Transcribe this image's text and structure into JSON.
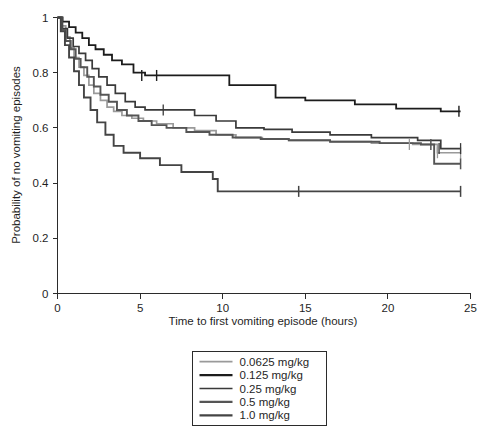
{
  "chart_data": {
    "type": "line",
    "subtype": "kaplan-meier-survival-step",
    "title": "",
    "xlabel": "Time to first vomiting episode (hours)",
    "ylabel": "Probability of no vomiting episodes",
    "xlim": [
      0,
      25
    ],
    "ylim": [
      0,
      1
    ],
    "xticks": [
      0,
      5,
      10,
      15,
      20,
      25
    ],
    "xtick_labels": [
      "0",
      "5",
      "10",
      "15",
      "20",
      "25"
    ],
    "yticks": [
      0,
      0.2,
      0.4,
      0.6,
      0.8,
      1
    ],
    "ytick_labels": [
      "0",
      "0.2",
      "0.4",
      "0.6",
      "0.8",
      "1"
    ],
    "grid": false,
    "legend_position": "bottom-center",
    "series": [
      {
        "name": "0.0625 mg/kg",
        "color": "#9a9a9a",
        "width": 1.7,
        "points": [
          [
            0.0,
            1.0
          ],
          [
            0.25,
            0.97
          ],
          [
            0.5,
            0.93
          ],
          [
            0.75,
            0.89
          ],
          [
            1.0,
            0.855
          ],
          [
            1.3,
            0.82
          ],
          [
            1.6,
            0.79
          ],
          [
            1.9,
            0.755
          ],
          [
            2.2,
            0.725
          ],
          [
            2.6,
            0.7
          ],
          [
            3.0,
            0.675
          ],
          [
            3.4,
            0.66
          ],
          [
            3.9,
            0.645
          ],
          [
            4.5,
            0.635
          ],
          [
            5.2,
            0.625
          ],
          [
            6.0,
            0.615
          ],
          [
            7.0,
            0.6
          ],
          [
            8.3,
            0.59
          ],
          [
            9.6,
            0.575
          ],
          [
            10.8,
            0.565
          ],
          [
            12.4,
            0.56
          ],
          [
            14.0,
            0.555
          ],
          [
            16.5,
            0.55
          ],
          [
            19.0,
            0.545
          ],
          [
            21.5,
            0.54
          ],
          [
            23.0,
            0.51
          ],
          [
            24.4,
            0.51
          ]
        ],
        "censored": [
          [
            21.3,
            0.54
          ],
          [
            23.0,
            0.51
          ],
          [
            24.4,
            0.51
          ]
        ],
        "final_value": 0.51
      },
      {
        "name": "0.125 mg/kg",
        "color": "#1c1c1c",
        "width": 1.8,
        "points": [
          [
            0.0,
            1.0
          ],
          [
            0.3,
            0.985
          ],
          [
            0.7,
            0.965
          ],
          [
            1.1,
            0.945
          ],
          [
            1.5,
            0.925
          ],
          [
            1.9,
            0.9
          ],
          [
            2.3,
            0.885
          ],
          [
            2.8,
            0.865
          ],
          [
            3.3,
            0.845
          ],
          [
            3.9,
            0.83
          ],
          [
            4.6,
            0.8
          ],
          [
            5.3,
            0.79
          ],
          [
            7.3,
            0.79
          ],
          [
            10.4,
            0.755
          ],
          [
            13.2,
            0.71
          ],
          [
            15.0,
            0.7
          ],
          [
            18.0,
            0.685
          ],
          [
            20.5,
            0.67
          ],
          [
            23.2,
            0.66
          ],
          [
            24.4,
            0.66
          ]
        ],
        "censored": [
          [
            5.1,
            0.79
          ],
          [
            6.0,
            0.79
          ],
          [
            24.3,
            0.66
          ]
        ],
        "final_value": 0.66
      },
      {
        "name": "0.25 mg/kg",
        "color": "#3a3a3a",
        "width": 1.7,
        "points": [
          [
            0.0,
            1.0
          ],
          [
            0.3,
            0.96
          ],
          [
            0.6,
            0.925
          ],
          [
            0.95,
            0.895
          ],
          [
            1.3,
            0.87
          ],
          [
            1.7,
            0.845
          ],
          [
            2.1,
            0.815
          ],
          [
            2.5,
            0.785
          ],
          [
            3.0,
            0.755
          ],
          [
            3.5,
            0.725
          ],
          [
            4.1,
            0.695
          ],
          [
            4.7,
            0.675
          ],
          [
            5.3,
            0.665
          ],
          [
            7.0,
            0.665
          ],
          [
            8.3,
            0.645
          ],
          [
            9.6,
            0.625
          ],
          [
            10.8,
            0.6
          ],
          [
            12.5,
            0.595
          ],
          [
            14.2,
            0.585
          ],
          [
            16.5,
            0.575
          ],
          [
            19.0,
            0.565
          ],
          [
            21.8,
            0.555
          ],
          [
            23.2,
            0.525
          ],
          [
            24.4,
            0.525
          ]
        ],
        "censored": [
          [
            6.4,
            0.665
          ],
          [
            23.1,
            0.525
          ],
          [
            24.4,
            0.525
          ]
        ],
        "final_value": 0.525
      },
      {
        "name": "0.5 mg/kg",
        "color": "#555555",
        "width": 1.9,
        "points": [
          [
            0.0,
            1.0
          ],
          [
            0.25,
            0.955
          ],
          [
            0.5,
            0.915
          ],
          [
            0.8,
            0.885
          ],
          [
            1.1,
            0.85
          ],
          [
            1.4,
            0.82
          ],
          [
            1.8,
            0.785
          ],
          [
            2.2,
            0.75
          ],
          [
            2.6,
            0.72
          ],
          [
            3.1,
            0.695
          ],
          [
            3.6,
            0.665
          ],
          [
            4.2,
            0.645
          ],
          [
            4.9,
            0.625
          ],
          [
            5.7,
            0.61
          ],
          [
            6.6,
            0.6
          ],
          [
            7.8,
            0.585
          ],
          [
            9.2,
            0.575
          ],
          [
            10.6,
            0.565
          ],
          [
            12.3,
            0.56
          ],
          [
            14.0,
            0.555
          ],
          [
            16.5,
            0.55
          ],
          [
            19.5,
            0.545
          ],
          [
            22.0,
            0.54
          ],
          [
            22.8,
            0.47
          ],
          [
            24.4,
            0.47
          ]
        ],
        "censored": [
          [
            22.6,
            0.54
          ],
          [
            24.4,
            0.47
          ]
        ],
        "final_value": 0.47
      },
      {
        "name": "1.0 mg/kg",
        "color": "#444444",
        "width": 1.9,
        "points": [
          [
            0.0,
            1.0
          ],
          [
            0.2,
            0.95
          ],
          [
            0.45,
            0.9
          ],
          [
            0.7,
            0.855
          ],
          [
            1.0,
            0.805
          ],
          [
            1.3,
            0.755
          ],
          [
            1.6,
            0.71
          ],
          [
            2.0,
            0.665
          ],
          [
            2.4,
            0.62
          ],
          [
            2.9,
            0.575
          ],
          [
            3.4,
            0.535
          ],
          [
            4.0,
            0.51
          ],
          [
            5.0,
            0.49
          ],
          [
            6.2,
            0.465
          ],
          [
            7.5,
            0.44
          ],
          [
            9.4,
            0.415
          ],
          [
            9.7,
            0.37
          ],
          [
            14.5,
            0.37
          ],
          [
            20.0,
            0.37
          ],
          [
            24.4,
            0.37
          ]
        ],
        "censored": [
          [
            14.6,
            0.37
          ],
          [
            24.4,
            0.37
          ]
        ],
        "final_value": 0.37
      }
    ]
  },
  "axes": {
    "x_title": "Time to first vomiting episode (hours)",
    "y_title": "Probability of no vomiting episodes",
    "x_tick_labels": [
      "0",
      "5",
      "10",
      "15",
      "20",
      "25"
    ],
    "y_tick_labels": [
      "0",
      "0.2",
      "0.4",
      "0.6",
      "0.8",
      "1"
    ]
  },
  "legend": {
    "entries": [
      {
        "label": "0.0625 mg/kg",
        "color": "#9a9a9a",
        "width": 1.7
      },
      {
        "label": "0.125 mg/kg",
        "color": "#1c1c1c",
        "width": 2.2
      },
      {
        "label": "0.25 mg/kg",
        "color": "#3a3a3a",
        "width": 1.7
      },
      {
        "label": "0.5 mg/kg",
        "color": "#555555",
        "width": 2.2
      },
      {
        "label": "1.0 mg/kg",
        "color": "#444444",
        "width": 2.2
      }
    ]
  },
  "colors": {
    "background": "#ffffff",
    "axis": "#2b2b2b",
    "text": "#1f1f1f"
  }
}
